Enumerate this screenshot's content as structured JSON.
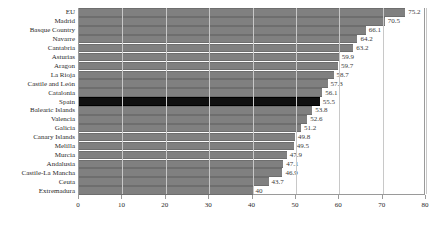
{
  "chart_data": {
    "type": "bar",
    "orientation": "horizontal",
    "title": "",
    "subtitle": "",
    "xlabel": "",
    "ylabel": "",
    "xlim": [
      0,
      80
    ],
    "xticks": [
      0,
      10,
      20,
      30,
      40,
      50,
      60,
      70,
      80
    ],
    "grid": "vertical",
    "legend": "none",
    "highlight_category": "Spain",
    "colors": {
      "bar": "#808080",
      "bar_highlight": "#101010",
      "grid": "#c8c8c8",
      "axis": "#9a9a9a",
      "text": "#2a2a2a",
      "value_text": "#3a3a3a"
    },
    "categories": [
      "EU",
      "Madrid",
      "Basque Country",
      "Navarre",
      "Cantabria",
      "Asturias",
      "Aragon",
      "La Rioja",
      "Castile and León",
      "Catalonia",
      "Spain",
      "Balearic Islands",
      "Valencia",
      "Galicia",
      "Canary Islands",
      "Melilla",
      "Murcia",
      "Andalusia",
      "Castile-La Mancha",
      "Ceuta",
      "Extremadura"
    ],
    "values": [
      75.2,
      70.5,
      66.1,
      64.2,
      63.2,
      59.9,
      59.7,
      58.7,
      57.3,
      56.1,
      55.5,
      53.8,
      52.6,
      51.2,
      49.8,
      49.5,
      47.9,
      47.1,
      46.9,
      43.7,
      40
    ],
    "value_labels": [
      "75.2",
      "70.5",
      "66.1",
      "64.2",
      "63.2",
      "59.9",
      "59.7",
      "58.7",
      "57.3",
      "56.1",
      "55.5",
      "53.8",
      "52.6",
      "51.2",
      "49.8",
      "49.5",
      "47.9",
      "47.1",
      "46.9",
      "43.7",
      "40"
    ],
    "xtick_labels": [
      "0",
      "10",
      "20",
      "30",
      "40",
      "50",
      "60",
      "70",
      "80"
    ]
  }
}
